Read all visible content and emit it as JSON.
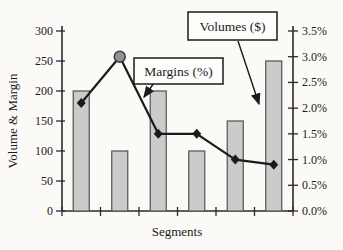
{
  "chart_data": {
    "type": "bar",
    "subtype": "combo-bar-line",
    "title": "",
    "xlabel": "Segments",
    "num_segments": 6,
    "left_axis": {
      "label": "Volume & Margin",
      "min": 0,
      "max": 300,
      "tick_labels": [
        "0",
        "50",
        "100",
        "150",
        "200",
        "250",
        "300"
      ]
    },
    "right_axis": {
      "label": "",
      "min": 0,
      "max": 3.5,
      "tick_labels": [
        "0.0%",
        "0.5%",
        "1.0%",
        "1.5%",
        "2.0%",
        "2.5%",
        "3.0%",
        "3.5%"
      ]
    },
    "series": [
      {
        "name": "Volumes ($)",
        "type": "bar",
        "axis": "left",
        "values": [
          200,
          100,
          200,
          100,
          150,
          250
        ]
      },
      {
        "name": "Margins (%)",
        "type": "line",
        "axis": "right",
        "values": [
          2.1,
          3.0,
          1.5,
          1.5,
          1.0,
          0.9
        ],
        "special_marker": {
          "index": 1,
          "shape": "circle"
        }
      }
    ],
    "annotations": [
      {
        "label": "Volumes ($)"
      },
      {
        "label": "Margins (%)"
      }
    ],
    "legend_position": "annotation-boxes",
    "grid": false,
    "colors": {
      "bar_fill": "#cbcbcb",
      "bar_stroke": "#5c5c5c",
      "line": "#1b1b1b",
      "marker": "#1b1b1b",
      "special_marker_fill": "#919191",
      "special_marker_stroke": "#3c3c3c",
      "text": "#1b1b1b",
      "background": "#fbfaf7"
    }
  }
}
